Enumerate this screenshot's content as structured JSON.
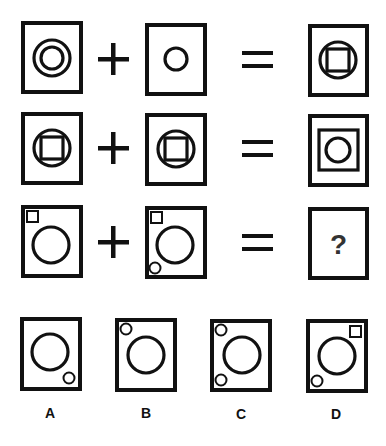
{
  "puzzle": {
    "type": "visual analogy / figure addition",
    "rows": [
      {
        "operands": [
          {
            "description": "double concentric circles"
          },
          {
            "description": "single small circle"
          }
        ],
        "operator_plus": "+",
        "operator_equals": "=",
        "result": {
          "description": "circle with inscribed square"
        }
      },
      {
        "operands": [
          {
            "description": "circle with inscribed square"
          },
          {
            "description": "circle with inscribed square"
          }
        ],
        "operator_plus": "+",
        "operator_equals": "=",
        "result": {
          "description": "square containing circle"
        }
      },
      {
        "operands": [
          {
            "description": "large circle, small square top-left"
          },
          {
            "description": "large circle, small square top-left, small circle bottom-left"
          }
        ],
        "operator_plus": "+",
        "operator_equals": "=",
        "result": {
          "description": "unknown",
          "text": "?"
        }
      }
    ],
    "options": [
      {
        "label": "A",
        "description": "large circle, small circle bottom-right"
      },
      {
        "label": "B",
        "description": "large circle, small circle top-left"
      },
      {
        "label": "C",
        "description": "large circle, small circles top-left and bottom-left"
      },
      {
        "label": "D",
        "description": "large circle, small square top-right, small circle bottom-left"
      }
    ]
  },
  "colors": {
    "stroke": "#111111",
    "background": "#ffffff"
  }
}
